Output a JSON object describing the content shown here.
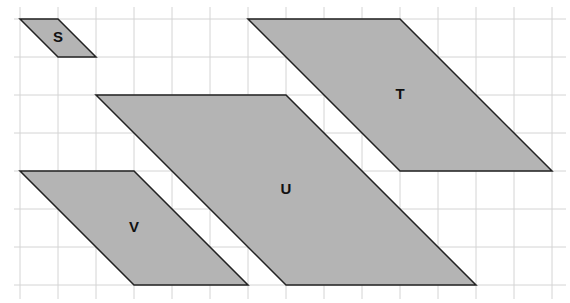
{
  "diagram": {
    "type": "parallelograms-on-grid",
    "grid": {
      "origin_x": 20,
      "origin_y": 19,
      "cell": 38,
      "cols": 14,
      "rows": 7,
      "line_color": "#d4d4d4",
      "extend_left": 6,
      "extend_bottom": 14
    },
    "fill_color": "#b4b4b4",
    "stroke_color": "#222222",
    "shapes": [
      {
        "label": "S",
        "points": [
          [
            0,
            0
          ],
          [
            1,
            0
          ],
          [
            2,
            1
          ],
          [
            1,
            1
          ]
        ],
        "label_pos": [
          1.0,
          0.5
        ]
      },
      {
        "label": "T",
        "points": [
          [
            6,
            0
          ],
          [
            10,
            0
          ],
          [
            14,
            4
          ],
          [
            10,
            4
          ]
        ],
        "label_pos": [
          10.0,
          2.0
        ]
      },
      {
        "label": "U",
        "points": [
          [
            2,
            2
          ],
          [
            7,
            2
          ],
          [
            12,
            7
          ],
          [
            7,
            7
          ]
        ],
        "label_pos": [
          7.0,
          4.5
        ]
      },
      {
        "label": "V",
        "points": [
          [
            0,
            4
          ],
          [
            3,
            4
          ],
          [
            6,
            7
          ],
          [
            3,
            7
          ]
        ],
        "label_pos": [
          3.0,
          5.5
        ]
      }
    ]
  }
}
